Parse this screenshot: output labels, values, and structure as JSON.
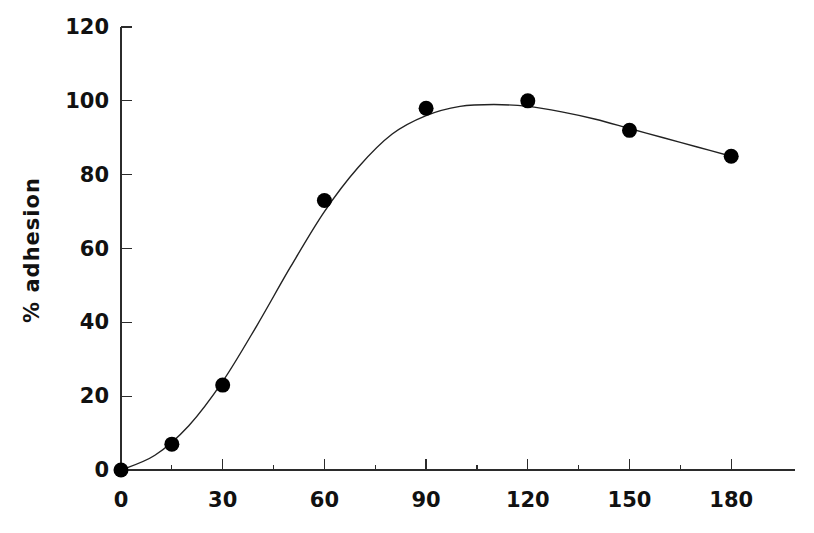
{
  "chart_data": {
    "type": "scatter",
    "title": "",
    "subtitle": "",
    "xlabel": "",
    "ylabel": "% adhesion",
    "xlim": [
      0,
      198
    ],
    "ylim": [
      0,
      120
    ],
    "grid": false,
    "legend": null,
    "x_ticks": [
      0,
      30,
      60,
      90,
      120,
      150,
      180
    ],
    "x_tick_labels": [
      "0",
      "30",
      "60",
      "90",
      "120",
      "150",
      "180"
    ],
    "x_minor_ticks": [
      15,
      45,
      75,
      105,
      135,
      165
    ],
    "y_ticks": [
      0,
      20,
      40,
      60,
      80,
      100,
      120
    ],
    "y_tick_labels": [
      "0",
      "20",
      "40",
      "60",
      "80",
      "100",
      "120"
    ],
    "series": [
      {
        "name": "% adhesion",
        "marker": "filled-circle",
        "color": "#000000",
        "x": [
          0,
          15,
          30,
          60,
          90,
          120,
          150,
          180
        ],
        "values": [
          0,
          7,
          23,
          73,
          98,
          100,
          92,
          85
        ]
      }
    ],
    "fit_curve": {
      "name": "sigmoid-fit",
      "color": "#222222",
      "x": [
        0,
        10,
        20,
        30,
        40,
        50,
        60,
        70,
        80,
        90,
        100,
        110,
        120,
        130,
        140,
        150,
        160,
        170,
        180
      ],
      "values": [
        0,
        4,
        12,
        24,
        39,
        55,
        70,
        82,
        91,
        96,
        98.5,
        99,
        98.5,
        97,
        95,
        92.5,
        90,
        87.5,
        85
      ]
    }
  },
  "axis": {
    "y_label": "% adhesion"
  }
}
